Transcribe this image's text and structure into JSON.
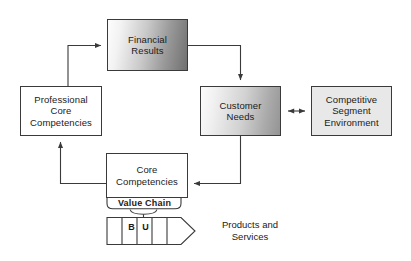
{
  "diagram": {
    "background_color": "#ffffff",
    "stroke_color": "#3a3a3a",
    "nodes": {
      "financial_results": {
        "label": "Financial\nResults",
        "fill_start": "#fdfdfd",
        "fill_end": "#707070"
      },
      "professional_core": {
        "label": "Professional\nCore\nCompetencies",
        "fill": "#ffffff"
      },
      "customer_needs": {
        "label": "Customer\nNeeds",
        "fill_start": "#fcfcfc",
        "fill_end": "#949494"
      },
      "competitive_segment": {
        "label": "Competitive\nSegment\nEnvironment",
        "fill": "#e8e8e8"
      },
      "core_competencies": {
        "label": "Core\nCompetencies",
        "fill": "#ffffff"
      },
      "value_chain": {
        "label": "Value Chain",
        "fill": "#ffffff"
      },
      "business_unit": {
        "segment_b": "B",
        "segment_u": "U",
        "fill": "#ffffff"
      },
      "products_services": {
        "label": "Products and\nServices"
      }
    },
    "connectors": [
      {
        "name": "professional-core-to-financial-results",
        "from": "professional_core",
        "to": "financial_results",
        "style": "elbow-single-arrow"
      },
      {
        "name": "financial-results-to-customer-needs",
        "from": "financial_results",
        "to": "customer_needs",
        "style": "elbow-single-arrow"
      },
      {
        "name": "customer-needs-to-competitive-segment",
        "from": "customer_needs",
        "to": "competitive_segment",
        "style": "straight-double-arrow"
      },
      {
        "name": "customer-needs-to-core-competencies",
        "from": "customer_needs",
        "to": "core_competencies",
        "style": "elbow-single-arrow"
      },
      {
        "name": "core-competencies-to-professional-core",
        "from": "core_competencies",
        "to": "professional_core",
        "style": "elbow-single-arrow"
      },
      {
        "name": "value-chain-to-business-unit",
        "from": "value_chain",
        "to": "business_unit",
        "style": "bracket-pointer"
      }
    ]
  }
}
